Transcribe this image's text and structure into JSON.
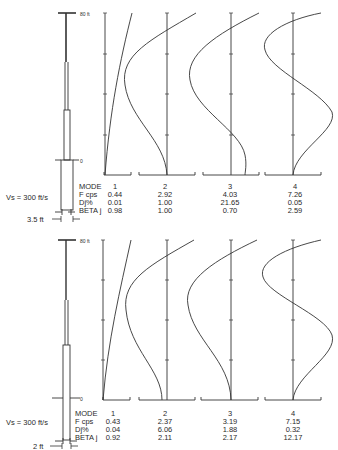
{
  "panels": [
    {
      "id": "upper",
      "top_label": "80 ft",
      "base_label": "0",
      "shear_velocity_label": "Vs = 300 ft/s",
      "width_label": "3.5 ft",
      "table": {
        "row_labels": [
          "MODE",
          "F cps",
          "Dj%",
          "BETA j"
        ],
        "modes": [
          {
            "mode": "1",
            "f_cps": "0.44",
            "dj_pct": "0.01",
            "beta_j": "0.98"
          },
          {
            "mode": "2",
            "f_cps": "2.92",
            "dj_pct": "1.00",
            "beta_j": "1.00"
          },
          {
            "mode": "3",
            "f_cps": "4.03",
            "dj_pct": "21.65",
            "beta_j": "0.70"
          },
          {
            "mode": "4",
            "f_cps": "7.26",
            "dj_pct": "0.05",
            "beta_j": "2.59"
          }
        ]
      }
    },
    {
      "id": "lower",
      "top_label": "80 ft",
      "base_label": "0",
      "shear_velocity_label": "Vs = 300 ft/s",
      "width_label": "2 ft",
      "table": {
        "row_labels": [
          "MODE",
          "F cps",
          "Dj%",
          "BETA j"
        ],
        "modes": [
          {
            "mode": "1",
            "f_cps": "0.43",
            "dj_pct": "0.04",
            "beta_j": "0.92"
          },
          {
            "mode": "2",
            "f_cps": "2.37",
            "dj_pct": "6.06",
            "beta_j": "2.11"
          },
          {
            "mode": "3",
            "f_cps": "3.19",
            "dj_pct": "1.88",
            "beta_j": "2.17"
          },
          {
            "mode": "4",
            "f_cps": "7.15",
            "dj_pct": "0.32",
            "beta_j": "12.17"
          }
        ]
      }
    }
  ]
}
